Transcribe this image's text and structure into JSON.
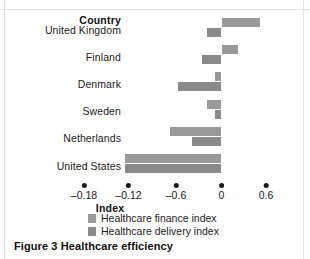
{
  "caption": "Figure 3 Healthcare efficiency",
  "category_header": "Country",
  "chart_data": {
    "type": "bar",
    "orientation": "horizontal",
    "title": "Figure 3 Healthcare efficiency",
    "xlabel": "Index",
    "ylabel": "Country",
    "grid": false,
    "legend_position": "bottom",
    "categories": [
      "United Kingdom",
      "Finland",
      "Denmark",
      "Sweden",
      "Netherlands",
      "United States"
    ],
    "series": [
      {
        "name": "Healthcare finance index",
        "color": "#9a9a9a",
        "values": [
          0.52,
          0.22,
          -0.09,
          -0.19,
          -0.7,
          -1.3
        ]
      },
      {
        "name": "Healthcare delivery index",
        "color": "#8a8a8a",
        "values": [
          -0.19,
          -0.27,
          -0.59,
          -0.09,
          -0.4,
          -1.3
        ]
      }
    ],
    "tick_labels": [
      "–0.18",
      "–0.12",
      "–0.6",
      "0",
      "0.6"
    ],
    "tick_values": [
      -1.8,
      -1.2,
      -0.6,
      0,
      0.6
    ],
    "xlim": [
      -1.8,
      0.6
    ]
  },
  "axis": {
    "title": "Index"
  },
  "colors": {
    "finance": "#9a9a9a",
    "delivery": "#8a8a8a",
    "text": "#1a1a1a"
  }
}
